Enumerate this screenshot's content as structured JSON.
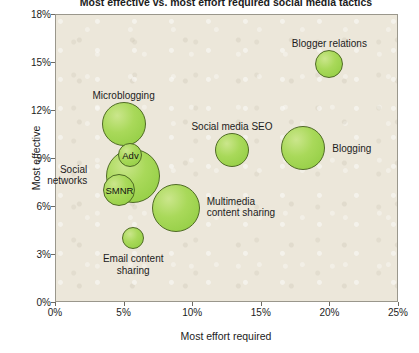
{
  "chart_data": {
    "type": "scatter",
    "variant": "bubble",
    "title": "Most effective vs. most effort required social media tactics",
    "xlabel": "Most effort required",
    "ylabel": "Most effective",
    "xlim": [
      0,
      25
    ],
    "ylim": [
      0,
      18
    ],
    "xtick_labels": [
      "0%",
      "5%",
      "10%",
      "15%",
      "20%",
      "25%"
    ],
    "xticks": [
      0,
      5,
      10,
      15,
      20,
      25
    ],
    "ytick_labels": [
      "0%",
      "3%",
      "6%",
      "9%",
      "12%",
      "15%",
      "18%"
    ],
    "yticks": [
      0,
      3,
      6,
      9,
      12,
      15,
      18
    ],
    "grid": false,
    "legend": "none",
    "plot_background": "#ece7da",
    "bubble_fill": "#a9d95a",
    "bubble_stroke": "#4f6b24",
    "points": [
      {
        "label": "Microblogging",
        "x": 5.0,
        "y": 11.1,
        "r_px": 22,
        "label_position": "above",
        "label_dx": 0,
        "label_dy": -34,
        "inner_label": ""
      },
      {
        "label": "Social\nnetworks",
        "x": 5.7,
        "y": 7.9,
        "r_px": 27,
        "label_position": "left",
        "label_dx": -46,
        "label_dy": -12,
        "inner_label": ""
      },
      {
        "label": "",
        "x": 5.5,
        "y": 9.2,
        "r_px": 12,
        "label_position": "none",
        "label_dx": 0,
        "label_dy": 0,
        "inner_label": "Adv"
      },
      {
        "label": "",
        "x": 4.7,
        "y": 7.0,
        "r_px": 16,
        "label_position": "none",
        "label_dx": 0,
        "label_dy": 0,
        "inner_label": "SMNR"
      },
      {
        "label": "Multimedia\ncontent sharing",
        "x": 8.8,
        "y": 5.9,
        "r_px": 24,
        "label_position": "right",
        "label_dx": 31,
        "label_dy": -12,
        "inner_label": ""
      },
      {
        "label": "Email content\nsharing",
        "x": 5.7,
        "y": 4.0,
        "r_px": 11,
        "label_position": "below",
        "label_dx": 0,
        "label_dy": 15,
        "inner_label": ""
      },
      {
        "label": "Social media SEO",
        "x": 12.9,
        "y": 9.5,
        "r_px": 17,
        "label_position": "above",
        "label_dx": 0,
        "label_dy": -29,
        "inner_label": ""
      },
      {
        "label": "Blogging",
        "x": 18.1,
        "y": 9.6,
        "r_px": 22,
        "label_position": "right",
        "label_dx": 29,
        "label_dy": -5,
        "inner_label": ""
      },
      {
        "label": "Blogger relations",
        "x": 20.0,
        "y": 14.9,
        "r_px": 14,
        "label_position": "above",
        "label_dx": 0,
        "label_dy": -26,
        "inner_label": ""
      }
    ]
  }
}
